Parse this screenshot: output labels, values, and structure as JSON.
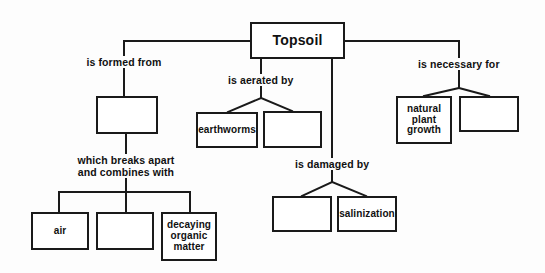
{
  "diagram": {
    "type": "concept-map",
    "background_color": "#fdfdfd",
    "line_color": "#1a1a1a",
    "text_color": "#111111",
    "root": {
      "label": "Topsoil",
      "x": 250,
      "y": 22,
      "w": 95,
      "h": 37
    },
    "labels": [
      {
        "id": "is-formed-from",
        "text": "is formed from",
        "x": 124,
        "y": 62
      },
      {
        "id": "which-breaks-apart",
        "text": "which breaks apart\nand combines with",
        "x": 126,
        "y": 166
      },
      {
        "id": "is-aerated-by",
        "text": "is aerated by",
        "x": 261,
        "y": 80
      },
      {
        "id": "is-damaged-by",
        "text": "is damaged by",
        "x": 332,
        "y": 164
      },
      {
        "id": "is-necessary-for",
        "text": "is necessary for",
        "x": 459,
        "y": 64
      }
    ],
    "nodes": [
      {
        "id": "formed-from-box",
        "text": "",
        "x": 96,
        "y": 96,
        "w": 62,
        "h": 38
      },
      {
        "id": "air-box",
        "text": "air",
        "x": 31,
        "y": 212,
        "w": 58,
        "h": 38
      },
      {
        "id": "middle-blank-box",
        "text": "",
        "x": 96,
        "y": 212,
        "w": 58,
        "h": 38
      },
      {
        "id": "decaying-box",
        "text": "decaying\norganic\nmatter",
        "x": 161,
        "y": 212,
        "w": 56,
        "h": 49
      },
      {
        "id": "earthworms-box",
        "text": "earthworms",
        "x": 196,
        "y": 112,
        "w": 62,
        "h": 36
      },
      {
        "id": "aerated-blank-box",
        "text": "",
        "x": 263,
        "y": 111,
        "w": 59,
        "h": 37
      },
      {
        "id": "damaged-blank-box",
        "text": "",
        "x": 272,
        "y": 196,
        "w": 60,
        "h": 36
      },
      {
        "id": "salinization-box",
        "text": "salinization",
        "x": 337,
        "y": 196,
        "w": 60,
        "h": 36
      },
      {
        "id": "natural-growth-box",
        "text": "natural\nplant\ngrowth",
        "x": 396,
        "y": 96,
        "w": 56,
        "h": 48
      },
      {
        "id": "necessary-blank-box",
        "text": "",
        "x": 459,
        "y": 96,
        "w": 60,
        "h": 36
      }
    ],
    "connectors": [
      {
        "id": "root-to-left-branch",
        "points": "124,41 124,96"
      },
      {
        "id": "root-left-horizontal",
        "points": "124,41 250,41"
      },
      {
        "id": "root-right-horizontal",
        "points": "345,41 459,41"
      },
      {
        "id": "root-to-right-branch",
        "points": "459,41 459,56"
      },
      {
        "id": "formed-box-down",
        "points": "126,134 126,192"
      },
      {
        "id": "bottom-left-bar",
        "points": "59,192 190,192"
      },
      {
        "id": "air-stem",
        "points": "59,192 59,212"
      },
      {
        "id": "middle-stem",
        "points": "126,192 126,212"
      },
      {
        "id": "decaying-stem",
        "points": "190,192 190,212"
      },
      {
        "id": "aerated-stem",
        "points": "261,59 261,98"
      },
      {
        "id": "aerated-left-diag",
        "points": "261,98 228,112"
      },
      {
        "id": "aerated-right-diag",
        "points": "261,98 292,111"
      },
      {
        "id": "damaged-stem",
        "points": "332,59 332,182"
      },
      {
        "id": "damaged-left-diag",
        "points": "332,182 302,196"
      },
      {
        "id": "damaged-right-diag",
        "points": "332,182 366,196"
      },
      {
        "id": "necessary-stem",
        "points": "459,41 459,88"
      },
      {
        "id": "necessary-left-diag",
        "points": "459,88 424,96"
      },
      {
        "id": "necessary-right-diag",
        "points": "459,88 489,96"
      }
    ]
  }
}
